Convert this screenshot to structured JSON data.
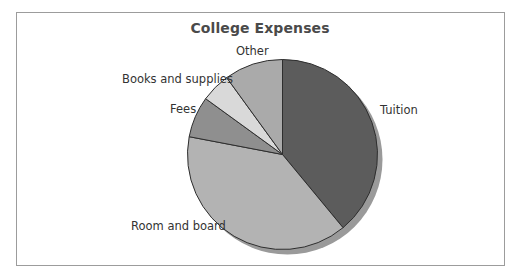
{
  "chart_data": {
    "type": "pie",
    "title": "College Expenses",
    "categories": [
      "Tuition",
      "Room and board",
      "Fees",
      "Books and supplies",
      "Other"
    ],
    "values": [
      39,
      39,
      7,
      5,
      10
    ],
    "unit": "percent (estimated from slice angles; no values printed)",
    "start_angle": "12 o'clock",
    "direction": "clockwise",
    "colors": [
      "#5c5c5c",
      "#b3b3b3",
      "#8f8f8f",
      "#d9d9d9",
      "#aaaaaa"
    ],
    "shadow_color": "#9a9a9a",
    "legend": "none (direct labels next to slices)",
    "grid": false
  },
  "labels": {
    "tuition": "Tuition",
    "room_and_board": "Room and board",
    "fees": "Fees",
    "books_and_supplies": "Books and supplies",
    "other": "Other"
  }
}
